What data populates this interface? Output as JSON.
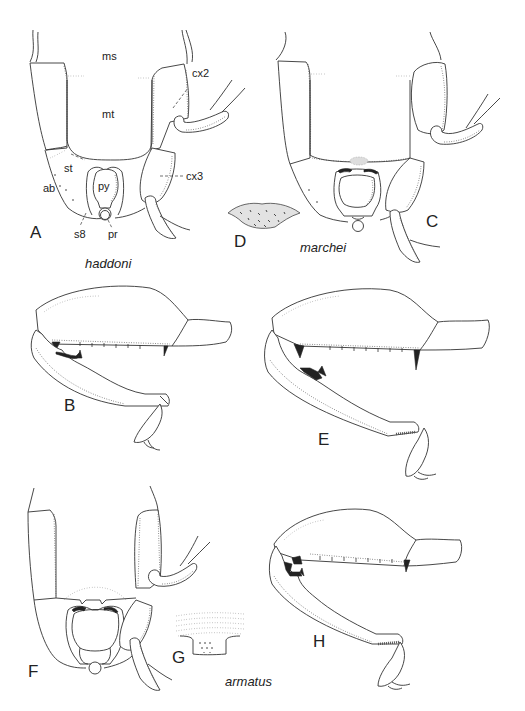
{
  "figure": {
    "background": "#ffffff",
    "line_color": "#333333",
    "panels": [
      {
        "id": "A",
        "letter": "A",
        "description": "ventral thorax and abdomen",
        "species": "haddoni"
      },
      {
        "id": "B",
        "letter": "B",
        "description": "fore leg",
        "species": "haddoni"
      },
      {
        "id": "C",
        "letter": "C",
        "description": "ventral thorax and abdomen",
        "species": "marchei"
      },
      {
        "id": "D",
        "letter": "D",
        "description": "metasternal process detail",
        "species": "marchei"
      },
      {
        "id": "E",
        "letter": "E",
        "description": "fore leg",
        "species": "marchei"
      },
      {
        "id": "F",
        "letter": "F",
        "description": "ventral thorax and abdomen",
        "species": "armatus"
      },
      {
        "id": "G",
        "letter": "G",
        "description": "metasternal process detail",
        "species": "armatus"
      },
      {
        "id": "H",
        "letter": "H",
        "description": "fore leg",
        "species": "armatus"
      }
    ],
    "species_labels": {
      "haddoni": "haddoni",
      "marchei": "marchei",
      "armatus": "armatus"
    },
    "annotations": {
      "ms": "ms",
      "mt": "mt",
      "cx2": "cx2",
      "cx3": "cx3",
      "st": "st",
      "ab": "ab",
      "py": "py",
      "s8": "s8",
      "pr": "pr"
    }
  }
}
